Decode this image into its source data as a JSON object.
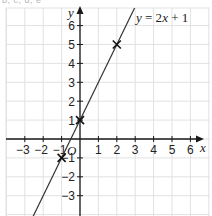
{
  "header_fragment": "b, c, d, e",
  "chart_data": {
    "type": "line",
    "title": "",
    "equation_label": "y = 2x + 1",
    "xlabel": "x",
    "ylabel": "y",
    "origin_label": "O",
    "xlim": [
      -4,
      7
    ],
    "ylim": [
      -4,
      7
    ],
    "x_ticks": [
      -3,
      -2,
      -1,
      1,
      2,
      3,
      4,
      5,
      6
    ],
    "y_ticks": [
      -3,
      -2,
      -1,
      1,
      2,
      3,
      4,
      5,
      6
    ],
    "x_tick_labels": [
      "−3",
      "−2",
      "−1",
      "1",
      "2",
      "3",
      "4",
      "5",
      "6"
    ],
    "y_tick_labels": [
      "−3",
      "−2",
      "−1",
      "1",
      "2",
      "3",
      "4",
      "5",
      "6"
    ],
    "grid": true,
    "series": [
      {
        "name": "y = 2x + 1",
        "slope": 2,
        "intercept": 1,
        "marked_points": [
          {
            "x": -1,
            "y": -1
          },
          {
            "x": 0,
            "y": 1
          },
          {
            "x": 2,
            "y": 5
          }
        ]
      }
    ]
  }
}
